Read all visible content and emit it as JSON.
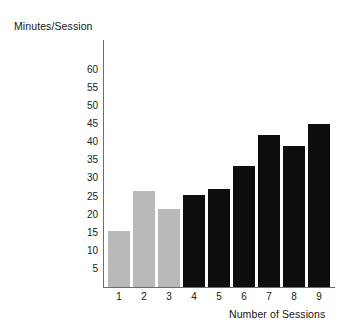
{
  "chart_data": {
    "type": "bar",
    "title": "",
    "xlabel": "Number of Sessions",
    "ylabel": "Minutes/Session",
    "categories": [
      "1",
      "2",
      "3",
      "4",
      "5",
      "6",
      "7",
      "8",
      "9"
    ],
    "values": [
      15.5,
      26.5,
      21.5,
      25.5,
      27,
      33.5,
      42,
      39,
      45
    ],
    "bar_colors": [
      "#b9b9b9",
      "#b9b9b9",
      "#b9b9b9",
      "#0d0d0d",
      "#0d0d0d",
      "#0d0d0d",
      "#0d0d0d",
      "#0d0d0d",
      "#0d0d0d"
    ],
    "ylim": [
      0,
      62
    ],
    "yticks": [
      60,
      55,
      50,
      45,
      40,
      35,
      30,
      25,
      20,
      15,
      10,
      5
    ],
    "ytick_labels": [
      "60",
      "55",
      "50",
      "45",
      "40",
      "35",
      "30",
      "25",
      "20",
      "15",
      "10",
      "5"
    ],
    "grid": false,
    "legend": null,
    "axis_color": "#6e6e6e",
    "background": "#ffffff"
  },
  "axes": {
    "y_title": "Minutes/Session",
    "x_title": "Number of Sessions"
  }
}
